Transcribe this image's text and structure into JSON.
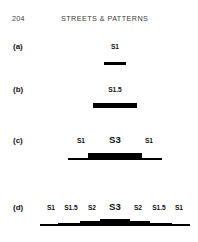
{
  "page": {
    "folio": "204",
    "running_title": "STREETS & PATTERNS",
    "background_color": "#ffffff",
    "ink_color": "#000000"
  },
  "chart_data": {
    "type": "bar",
    "title": "STREETS & PATTERNS",
    "subtitle": "Street hierarchy cross-section diagrams",
    "xlabel": "",
    "ylabel": "",
    "orientation": "horizontal-profile",
    "note": "Each row is a symmetric street cross-section profile; bar thickness encodes street class S1 (thinnest) to S3 (thickest).",
    "rows": [
      {
        "key": "a",
        "label": "(a)",
        "segments": [
          {
            "label": "S1",
            "class": "S1",
            "x_start": 104,
            "x_end": 126,
            "center": 115,
            "thickness": 3,
            "emphasis": "normal"
          }
        ]
      },
      {
        "key": "b",
        "label": "(b)",
        "segments": [
          {
            "label": "S1.5",
            "class": "S1.5",
            "x_start": 93,
            "x_end": 137,
            "center": 115,
            "thickness": 5,
            "emphasis": "normal"
          }
        ]
      },
      {
        "key": "c",
        "label": "(c)",
        "segments": [
          {
            "label": "S1",
            "class": "S1",
            "x_start": 68,
            "x_end": 94,
            "center": 81,
            "thickness": 2,
            "emphasis": "normal"
          },
          {
            "label": "S3",
            "class": "S3",
            "x_start": 88,
            "x_end": 142,
            "center": 115,
            "thickness": 7,
            "emphasis": "strong"
          },
          {
            "label": "S1",
            "class": "S1",
            "x_start": 136,
            "x_end": 162,
            "center": 149,
            "thickness": 2,
            "emphasis": "normal"
          }
        ]
      },
      {
        "key": "d",
        "label": "(d)",
        "segments": [
          {
            "label": "S1",
            "class": "S1",
            "x_start": 40,
            "x_end": 62,
            "center": 51,
            "thickness": 2,
            "emphasis": "normal"
          },
          {
            "label": "S1.5",
            "class": "S1.5",
            "x_start": 58,
            "x_end": 84,
            "center": 71,
            "thickness": 3,
            "emphasis": "normal"
          },
          {
            "label": "S2",
            "class": "S2",
            "x_start": 80,
            "x_end": 104,
            "center": 92,
            "thickness": 5,
            "emphasis": "normal"
          },
          {
            "label": "S3",
            "class": "S3",
            "x_start": 100,
            "x_end": 130,
            "center": 115,
            "thickness": 7,
            "emphasis": "strong"
          },
          {
            "label": "S2",
            "class": "S2",
            "x_start": 126,
            "x_end": 150,
            "center": 138,
            "thickness": 5,
            "emphasis": "normal"
          },
          {
            "label": "S1.5",
            "class": "S1.5",
            "x_start": 146,
            "x_end": 172,
            "center": 159,
            "thickness": 3,
            "emphasis": "normal"
          },
          {
            "label": "S1",
            "class": "S1",
            "x_start": 168,
            "x_end": 190,
            "center": 179,
            "thickness": 2,
            "emphasis": "normal"
          }
        ]
      }
    ]
  }
}
